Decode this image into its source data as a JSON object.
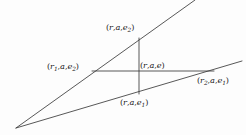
{
  "figure": {
    "kind": "geometry-diagram",
    "width": 246,
    "height": 135,
    "background_color": "#fdfdfd",
    "stroke_color": "#3a3a3a",
    "text_color": "#1a1a1a",
    "labels": {
      "top": {
        "open": "(",
        "v1": "r",
        "c1": ",",
        "v2": "a",
        "c2": ",",
        "v3": "e",
        "sub3": "2",
        "close": ")"
      },
      "left": {
        "open": "(",
        "v1": "r",
        "sub1": "1",
        "c1": ",",
        "v2": "a",
        "c2": ",",
        "v3": "e",
        "sub3": "2",
        "close": ")"
      },
      "center": {
        "open": "(",
        "v1": "r",
        "c1": ",",
        "v2": "a",
        "c2": ",",
        "v3": "e",
        "sub3": "",
        "close": ")"
      },
      "right": {
        "open": "(",
        "v1": "r",
        "sub1": "2",
        "c1": ",",
        "v2": "a",
        "c2": ",",
        "v3": "e",
        "sub3": "1",
        "close": ")"
      },
      "bottom": {
        "open": "(",
        "v1": "r",
        "c1": ",",
        "v2": "a",
        "c2": ",",
        "v3": "e",
        "sub3": "1",
        "close": ")"
      }
    },
    "geometry": {
      "apex": {
        "x": 16,
        "y": 128
      },
      "upper_ray_end": {
        "x": 195,
        "y": 0
      },
      "lower_ray_end": {
        "x": 242,
        "y": 61
      },
      "horizontal_line": {
        "x1": 92,
        "y1": 71,
        "x2": 214,
        "y2": 71
      },
      "vertical_line": {
        "x1": 139,
        "y1": 38,
        "x2": 139,
        "y2": 94
      },
      "points": {
        "top": {
          "x": 139,
          "y": 38
        },
        "left": {
          "x": 92,
          "y": 71
        },
        "center": {
          "x": 139,
          "y": 71
        },
        "right": {
          "x": 214,
          "y": 71
        },
        "bottom": {
          "x": 139,
          "y": 94
        }
      }
    }
  }
}
